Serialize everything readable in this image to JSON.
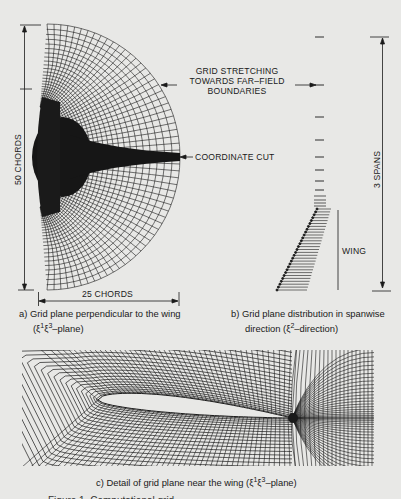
{
  "figure": {
    "panel_a": {
      "vertical_dimension": "50 CHORDS",
      "horizontal_dimension": "25 CHORDS",
      "caption_line1": "a)  Grid plane perpendicular to the wing",
      "caption_line2_prefix": "(ξ",
      "caption_sup1": "1",
      "caption_mid": "ξ",
      "caption_sup2": "3",
      "caption_line2_suffix": "–plane)"
    },
    "annotations": {
      "stretching_line1": "GRID STRETCHING",
      "stretching_line2": "TOWARDS FAR–FIELD",
      "stretching_line3": "BOUNDARIES",
      "coordinate_cut": "COORDINATE CUT"
    },
    "panel_b": {
      "vertical_dimension": "3 SPANS",
      "wing_label": "WING",
      "caption_line1": "b)  Grid plane distribution in spanwise",
      "caption_line2_prefix": "direction (ξ",
      "caption_sup": "2",
      "caption_line2_suffix": "–direction)"
    },
    "panel_c": {
      "caption_prefix": "c)  Detail of grid plane near the wing (ξ",
      "caption_sup1": "1",
      "caption_mid": "ξ",
      "caption_sup2": "3",
      "caption_suffix": "–plane)"
    },
    "footer_partial": "Figure 1.  Computational grid ...",
    "colors": {
      "background": "#e8e8e6",
      "ink": "#1a1a1a"
    }
  }
}
